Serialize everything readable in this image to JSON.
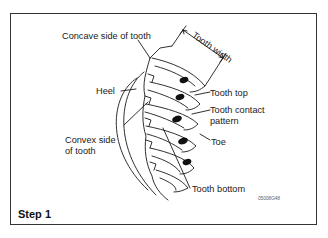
{
  "figure": {
    "labels": {
      "concave_side": "Concave side of tooth",
      "tooth_width": "Tooth width",
      "heel": "Heel",
      "tooth_top": "Tooth top",
      "tooth_contact_line1": "Tooth contact",
      "tooth_contact_line2": "pattern",
      "convex_side_line1": "Convex side",
      "convex_side_line2": "of tooth",
      "toe": "Toe",
      "tooth_bottom": "Tooth bottom"
    },
    "caption": "Step 1",
    "code": "05008G48"
  }
}
